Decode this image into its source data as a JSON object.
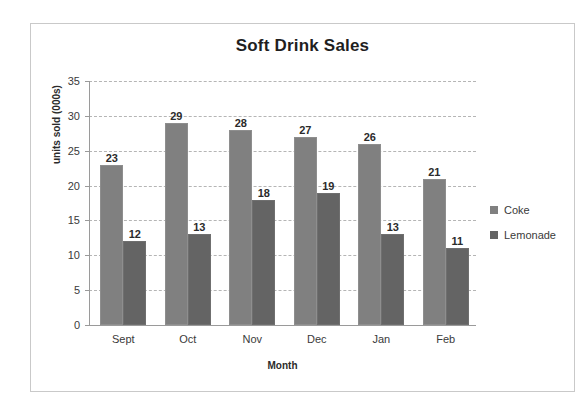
{
  "chart_data": {
    "type": "bar",
    "title": "Soft Drink Sales",
    "xlabel": "Month",
    "ylabel": "units sold (000s)",
    "categories": [
      "Sept",
      "Oct",
      "Nov",
      "Dec",
      "Jan",
      "Feb"
    ],
    "series": [
      {
        "name": "Coke",
        "color": "#808080",
        "values": [
          23,
          29,
          28,
          27,
          26,
          21
        ]
      },
      {
        "name": "Lemonade",
        "color": "#646464",
        "values": [
          12,
          13,
          18,
          19,
          13,
          11
        ]
      }
    ],
    "ylim": [
      0,
      35
    ],
    "yticks": [
      0,
      5,
      10,
      15,
      20,
      25,
      30,
      35
    ],
    "ytick_labels": [
      "0",
      "5",
      "10",
      "15",
      "20",
      "25",
      "30",
      "35"
    ],
    "grid": "horizontal-dashed",
    "data_labels": true,
    "legend_position": "right"
  },
  "legend": {
    "items": [
      {
        "label": "Coke",
        "swatch": "coke"
      },
      {
        "label": "Lemonade",
        "swatch": "lemonade"
      }
    ]
  }
}
